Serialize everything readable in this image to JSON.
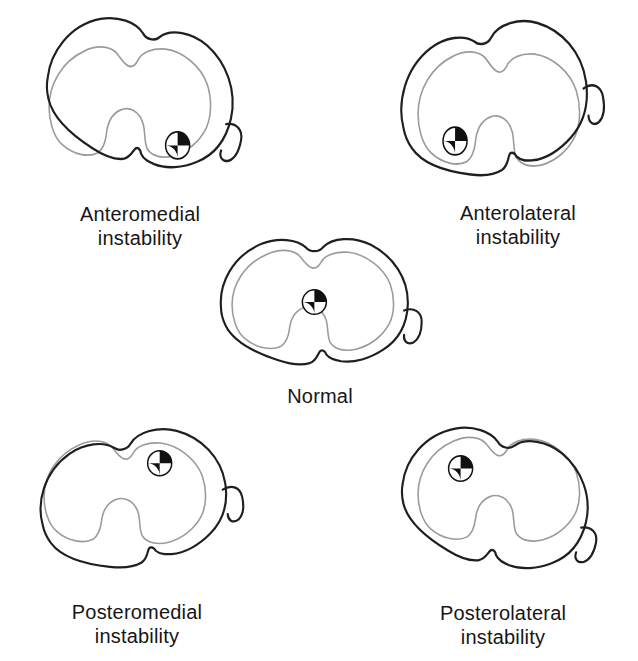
{
  "figure": {
    "background": "#ffffff",
    "displaced_outline_color": "#1f1f1f",
    "reference_outline_color": "#9b9b9b",
    "marker_style": "quadrant black/white center-of-rotation symbol",
    "marker_radius": 13
  },
  "panels": [
    {
      "id": "anteromedial",
      "label_line1": "Anteromedial",
      "label_line2": "instability",
      "marker": {
        "x": 165,
        "y": 121
      },
      "rotation_deg": 12,
      "box": {
        "left": 25,
        "top": 20,
        "width": 222,
        "height": 170
      },
      "label": {
        "x": 140,
        "y": 202
      }
    },
    {
      "id": "anterolateral",
      "label_line1": "Anterolateral",
      "label_line2": "instability",
      "marker": {
        "x": 66,
        "y": 109
      },
      "rotation_deg": -12,
      "box": {
        "left": 394,
        "top": 24,
        "width": 222,
        "height": 176
      },
      "label": {
        "x": 518,
        "y": 201
      }
    },
    {
      "id": "normal",
      "label_line1": "Normal",
      "label_line2": "",
      "marker": {
        "x": 115,
        "y": 81
      },
      "rotation_deg": 0,
      "box": {
        "left": 208,
        "top": 226,
        "width": 222,
        "height": 154
      },
      "label": {
        "x": 320,
        "y": 384
      }
    },
    {
      "id": "posteromedial",
      "label_line1": "Posteromedial",
      "label_line2": "instability",
      "marker": {
        "x": 151,
        "y": 49
      },
      "rotation_deg": -12,
      "box": {
        "left": 20,
        "top": 416,
        "width": 222,
        "height": 158
      },
      "label": {
        "x": 137,
        "y": 600
      }
    },
    {
      "id": "posterolateral",
      "label_line1": "Posterolateral",
      "label_line2": "instability",
      "marker": {
        "x": 72,
        "y": 58
      },
      "rotation_deg": 12,
      "box": {
        "left": 394,
        "top": 412,
        "width": 222,
        "height": 160
      },
      "label": {
        "x": 503,
        "y": 601
      }
    }
  ]
}
